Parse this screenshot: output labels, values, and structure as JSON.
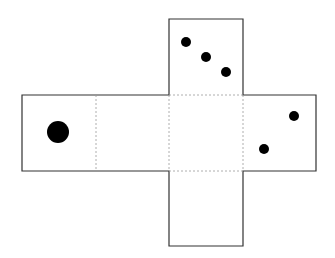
{
  "diagram": {
    "type": "cube-net",
    "faces": [
      {
        "id": "top",
        "x": 169,
        "y": 19,
        "w": 74,
        "h": 76,
        "pips": [
          [
            186,
            42,
            5
          ],
          [
            206,
            57,
            5
          ],
          [
            226,
            72,
            5
          ]
        ]
      },
      {
        "id": "left",
        "x": 22,
        "y": 95,
        "w": 74,
        "h": 76,
        "pips": [
          [
            58,
            132,
            11
          ]
        ]
      },
      {
        "id": "left-center",
        "x": 96,
        "y": 95,
        "w": 73,
        "h": 76,
        "pips": []
      },
      {
        "id": "center",
        "x": 169,
        "y": 95,
        "w": 74,
        "h": 76,
        "pips": []
      },
      {
        "id": "right",
        "x": 243,
        "y": 95,
        "w": 73,
        "h": 76,
        "pips": [
          [
            294,
            116,
            5
          ],
          [
            264,
            149,
            5
          ]
        ]
      },
      {
        "id": "bottom",
        "x": 169,
        "y": 171,
        "w": 74,
        "h": 75,
        "pips": []
      }
    ],
    "line_color": "#333333",
    "fold_color": "#999999",
    "pip_color": "#000000"
  }
}
